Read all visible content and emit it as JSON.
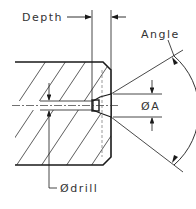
{
  "diagram": {
    "labels": {
      "depth": "Depth",
      "angle": "Angle",
      "diameter_a": "ØA",
      "diameter_drill": "Ødrill"
    },
    "colors": {
      "line": "#1a1a1a",
      "text": "#333333",
      "background": "#ffffff"
    }
  }
}
